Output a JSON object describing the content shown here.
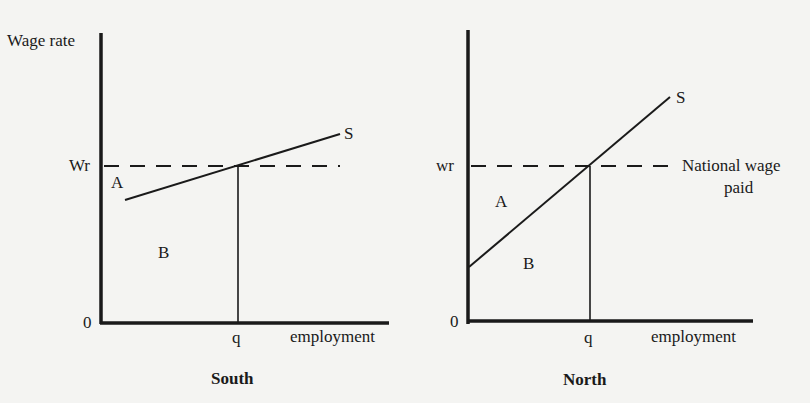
{
  "south": {
    "caption": "South",
    "y_axis_label": "Wage rate",
    "origin": "0",
    "wage_label": "Wr",
    "quantity_label": "q",
    "x_axis_label": "employment",
    "curve_label": "S",
    "area_a": "A",
    "area_b": "B"
  },
  "north": {
    "caption": "North",
    "origin": "0",
    "wage_label": "wr",
    "quantity_label": "q",
    "x_axis_label": "employment",
    "curve_label": "S",
    "area_a": "A",
    "area_b": "B",
    "wage_line_label_1": "National wage",
    "wage_line_label_2": "paid"
  },
  "colors": {
    "ink": "#1a1a1a",
    "paper": "#f4f4f2"
  }
}
